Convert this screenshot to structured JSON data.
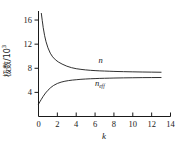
{
  "figure": {
    "background": "#ffffff",
    "line_color": "#1a1a1a",
    "axis_color": "#1a1a1a"
  },
  "chart_data": {
    "type": "line",
    "title": "",
    "xlabel": "k",
    "ylabel": "极数/10",
    "ylabel_exponent": "3",
    "xlim": [
      0,
      14
    ],
    "ylim": [
      0,
      17.5
    ],
    "xticks": [
      0,
      2,
      4,
      6,
      8,
      10,
      12,
      14
    ],
    "xticklabels": [
      "0",
      "2",
      "4",
      "6",
      "8",
      "10",
      "12",
      "14"
    ],
    "yticks": [
      4,
      8,
      12,
      16
    ],
    "yticklabels": [
      "4",
      "8",
      "12",
      "16"
    ],
    "grid": false,
    "legend": "inline-annotation",
    "series": [
      {
        "name": "n",
        "label": "n",
        "label_sub": "",
        "label_x": 6.6,
        "label_y": 8.9,
        "x": [
          0.3,
          0.4,
          0.5,
          0.65,
          0.8,
          1.0,
          1.25,
          1.5,
          1.8,
          2.1,
          2.5,
          3.0,
          3.5,
          4.0,
          4.5,
          5.0,
          5.5,
          6.0,
          6.5,
          7.0,
          7.5,
          8.0,
          9.0,
          10.0,
          11.0,
          12.0,
          13.0
        ],
        "y": [
          17.1,
          15.9,
          14.75,
          13.4,
          12.4,
          11.4,
          10.5,
          9.9,
          9.4,
          9.05,
          8.7,
          8.35,
          8.1,
          7.93,
          7.82,
          7.73,
          7.66,
          7.61,
          7.57,
          7.54,
          7.51,
          7.48,
          7.44,
          7.41,
          7.38,
          7.36,
          7.34
        ]
      },
      {
        "name": "n_eff",
        "label": "n",
        "label_sub": "eff",
        "label_x": 6.5,
        "label_y": 5.0,
        "x": [
          0.0,
          0.15,
          0.3,
          0.5,
          0.75,
          1.0,
          1.3,
          1.6,
          2.0,
          2.4,
          2.8,
          3.2,
          3.6,
          4.0,
          4.5,
          5.0,
          5.5,
          6.0,
          6.5,
          7.0,
          7.5,
          8.0,
          9.0,
          10.0,
          11.0,
          12.0,
          13.0
        ],
        "y": [
          2.05,
          2.45,
          2.85,
          3.35,
          3.9,
          4.35,
          4.8,
          5.15,
          5.48,
          5.7,
          5.85,
          5.96,
          6.04,
          6.1,
          6.17,
          6.22,
          6.26,
          6.29,
          6.32,
          6.34,
          6.36,
          6.38,
          6.41,
          6.43,
          6.45,
          6.46,
          6.47
        ]
      }
    ]
  }
}
